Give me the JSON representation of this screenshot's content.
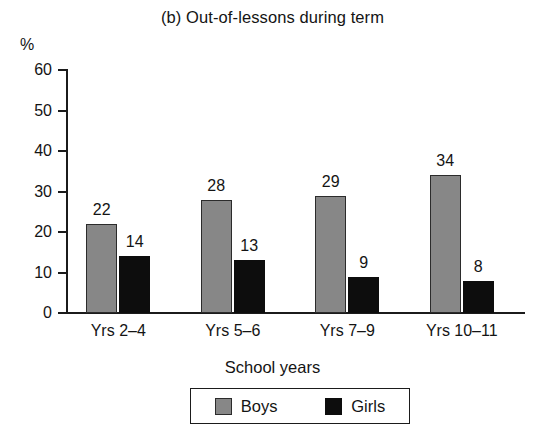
{
  "chart_data": {
    "type": "bar",
    "title": "(b) Out-of-lessons during term",
    "xlabel": "School years",
    "ylabel": "%",
    "categories": [
      "Yrs 2–4",
      "Yrs 5–6",
      "Yrs 7–9",
      "Yrs 10–11"
    ],
    "series": [
      {
        "name": "Boys",
        "values": [
          22,
          28,
          29,
          34
        ],
        "color": "#878787"
      },
      {
        "name": "Girls",
        "values": [
          14,
          13,
          9,
          8
        ],
        "color": "#0d0d0d"
      }
    ],
    "ylim": [
      0,
      60
    ],
    "yticks": [
      0,
      10,
      20,
      30,
      40,
      50,
      60
    ],
    "ytick_labels": [
      "0",
      "10",
      "20",
      "30",
      "40",
      "50",
      "60"
    ],
    "grid": false,
    "legend_position": "bottom",
    "data_labels": true
  },
  "legend": {
    "items": [
      {
        "label": "Boys",
        "swatch": "gray-square-swatch"
      },
      {
        "label": "Girls",
        "swatch": "black-square-swatch"
      }
    ]
  }
}
